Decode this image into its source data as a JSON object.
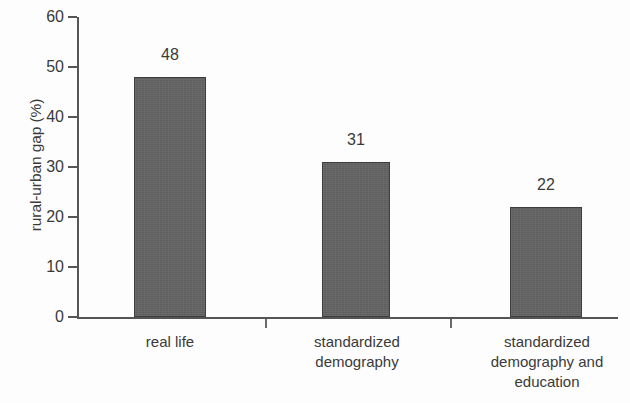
{
  "chart_data": {
    "type": "bar",
    "title": "",
    "subtitle": "",
    "xlabel": "",
    "ylabel": "rural-urban gap (%)",
    "categories": [
      "real life",
      "standardized demography",
      "standardized demography and education"
    ],
    "category_lines": [
      [
        "real life"
      ],
      [
        "standardized",
        "demography"
      ],
      [
        "standardized",
        "demography and",
        "education"
      ]
    ],
    "values": [
      48,
      31,
      22
    ],
    "value_labels": [
      "48",
      "31",
      "22"
    ],
    "ylim": [
      0,
      60
    ],
    "ytick_values": [
      0,
      10,
      20,
      30,
      40,
      50,
      60
    ],
    "ytick_labels": [
      "0",
      "10",
      "20",
      "30",
      "40",
      "50",
      "60"
    ],
    "grid": false,
    "legend": null,
    "bar_fill_color": "#636363",
    "bar_border_color": "#3d3d3d",
    "axis_color": "#555555",
    "text_color": "#3a3a3a",
    "background_color": "#fdfdfd"
  }
}
